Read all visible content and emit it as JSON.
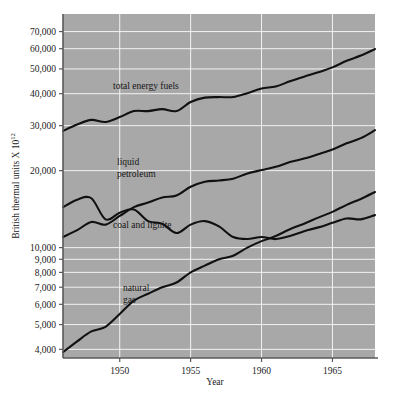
{
  "figure": {
    "background_color": "#ffffff",
    "plot_background_color": "#a8a8a8",
    "gridline_color": "#f2f2f2",
    "line_color": "#111111",
    "frame_color": "#6b6b6b"
  },
  "axes": {
    "y_title_main": "British thermal units X 10",
    "y_title_exponent": "12",
    "x_title": "Year",
    "y_ticks": [
      {
        "label": "70,000",
        "value": 70000
      },
      {
        "label": "60,000",
        "value": 60000
      },
      {
        "label": "50,000",
        "value": 50000
      },
      {
        "label": "40,000",
        "value": 40000
      },
      {
        "label": "30,000",
        "value": 30000
      },
      {
        "label": "20,000",
        "value": 20000
      },
      {
        "label": "10,000",
        "value": 10000
      },
      {
        "label": "9,000",
        "value": 9000
      },
      {
        "label": "8,000",
        "value": 8000
      },
      {
        "label": "7,000",
        "value": 7000
      },
      {
        "label": "6,000",
        "value": 6000
      },
      {
        "label": "5,000",
        "value": 5000
      },
      {
        "label": "4,000",
        "value": 4000
      }
    ],
    "x_ticks": [
      {
        "label": "1950",
        "value": 1950
      },
      {
        "label": "1955",
        "value": 1955
      },
      {
        "label": "1960",
        "value": 1960
      },
      {
        "label": "1965",
        "value": 1965
      }
    ]
  },
  "series_labels": {
    "total": "total energy fuels",
    "petroleum_line1": "liquid",
    "petroleum_line2": "petroleum",
    "coal": "coal and lignite",
    "gas_line1": "natural",
    "gas_line2": "gas"
  },
  "chart_data": {
    "type": "line",
    "title": "",
    "xlabel": "Year",
    "ylabel": "British thermal units X 10^12",
    "yscale": "log",
    "xlim": [
      1946,
      1968
    ],
    "ylim": [
      3700,
      82000
    ],
    "grid": true,
    "legend": "inline-labels",
    "x": [
      1946,
      1947,
      1948,
      1949,
      1950,
      1951,
      1952,
      1953,
      1954,
      1955,
      1956,
      1957,
      1958,
      1959,
      1960,
      1961,
      1962,
      1963,
      1964,
      1965,
      1966,
      1967,
      1968
    ],
    "series": [
      {
        "name": "total energy fuels",
        "label": "total energy fuels",
        "values": [
          28600,
          30300,
          31600,
          31000,
          32400,
          34200,
          34200,
          34800,
          34200,
          37100,
          38600,
          38800,
          38800,
          40200,
          41900,
          42700,
          44700,
          46600,
          48500,
          50700,
          53800,
          56400,
          59800
        ]
      },
      {
        "name": "liquid petroleum",
        "label": "liquid petroleum",
        "values": [
          11000,
          11700,
          12600,
          12300,
          13300,
          14400,
          15000,
          15700,
          16000,
          17300,
          18100,
          18300,
          18600,
          19500,
          20100,
          20700,
          21600,
          22300,
          23200,
          24200,
          25600,
          26800,
          28800
        ]
      },
      {
        "name": "coal and lignite",
        "label": "coal and lignite",
        "values": [
          14400,
          15400,
          15600,
          12900,
          13700,
          14100,
          12700,
          12400,
          11400,
          12300,
          12700,
          12100,
          11000,
          10800,
          11000,
          10800,
          11100,
          11600,
          12000,
          12500,
          13000,
          12900,
          13400
        ]
      },
      {
        "name": "natural gas",
        "label": "natural gas",
        "values": [
          3900,
          4300,
          4700,
          4900,
          5500,
          6200,
          6600,
          7000,
          7300,
          8000,
          8500,
          9000,
          9300,
          10000,
          10600,
          11100,
          11800,
          12400,
          13100,
          13800,
          14700,
          15500,
          16500
        ]
      }
    ]
  }
}
